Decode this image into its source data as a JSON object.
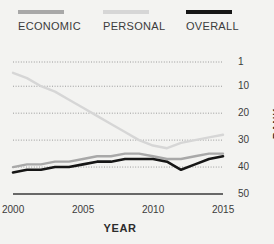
{
  "chart_data": {
    "type": "line",
    "title": "",
    "xlabel": "YEAR",
    "ylabel": "RANK",
    "xlim": [
      2000,
      2015
    ],
    "ylim": [
      1,
      50
    ],
    "y_inverted": true,
    "grid": true,
    "legend_position": "top",
    "x_ticks": [
      "2000",
      "2005",
      "2010",
      "2015"
    ],
    "x_tick_values": [
      2000,
      2005,
      2010,
      2015
    ],
    "y_ticks": [
      "1",
      "10",
      "20",
      "30",
      "40",
      "50"
    ],
    "y_tick_values": [
      1,
      10,
      20,
      30,
      40,
      50
    ],
    "x": [
      2000,
      2001,
      2002,
      2003,
      2004,
      2005,
      2006,
      2007,
      2008,
      2009,
      2010,
      2011,
      2012,
      2013,
      2014,
      2015
    ],
    "series": [
      {
        "name": "ECONOMIC",
        "color": "#a8a8a8",
        "values": [
          40,
          39,
          39,
          38,
          38,
          37,
          36,
          36,
          35,
          35,
          36,
          37,
          37,
          36,
          35,
          35
        ]
      },
      {
        "name": "PERSONAL",
        "color": "#d6d6d6",
        "values": [
          5,
          7,
          10,
          12,
          15,
          18,
          21,
          24,
          27,
          30,
          32,
          33,
          31,
          30,
          29,
          28
        ]
      },
      {
        "name": "OVERALL",
        "color": "#161616",
        "values": [
          42,
          41,
          41,
          40,
          40,
          39,
          38,
          38,
          37,
          37,
          37,
          38,
          41,
          39,
          37,
          36
        ]
      }
    ]
  },
  "legend": {
    "items": [
      {
        "label": "ECONOMIC",
        "color": "#a8a8a8"
      },
      {
        "label": "PERSONAL",
        "color": "#d6d6d6"
      },
      {
        "label": "OVERALL",
        "color": "#161616"
      }
    ]
  },
  "axes": {
    "x_title": "YEAR",
    "y_title": "RANK",
    "x_labels": [
      "2000",
      "2005",
      "2010",
      "2015"
    ],
    "y_labels": [
      "1",
      "10",
      "20",
      "30",
      "40",
      "50"
    ]
  },
  "theme": {
    "background": "#f3f3f1",
    "grid_color": "#9a9a9a",
    "axis_color": "#3a3a3a",
    "text_color": "#3b3b3b"
  }
}
